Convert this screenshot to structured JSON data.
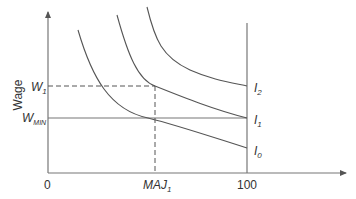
{
  "diagram": {
    "type": "indifference-curves",
    "y_axis_label": "Wage",
    "x_axis": {
      "origin_label": "0",
      "end_label": "100",
      "marked_point": {
        "main": "MAJ",
        "sub": "1"
      }
    },
    "y_axis": {
      "marks": [
        {
          "main": "W",
          "sub": "1"
        },
        {
          "main": "W",
          "sub": "MIN"
        }
      ]
    },
    "curves": [
      {
        "main": "I",
        "sub": "2"
      },
      {
        "main": "I",
        "sub": "1"
      },
      {
        "main": "I",
        "sub": "0"
      }
    ],
    "colors": {
      "axis": "#777777",
      "curve": "#555555",
      "text": "#333333"
    }
  }
}
